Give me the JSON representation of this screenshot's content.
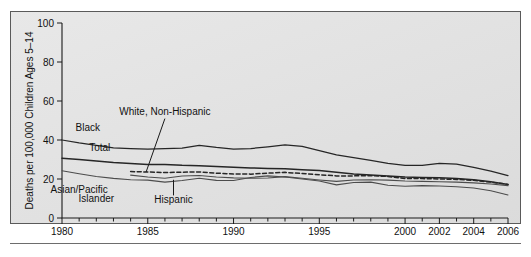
{
  "chart_data": {
    "type": "line",
    "title": "",
    "xlabel": "",
    "ylabel": "Deaths per 100,000 Children Ages 5–14",
    "ylim": [
      0,
      100
    ],
    "xlim": [
      1980,
      2006
    ],
    "yticks": [
      "0",
      "20",
      "40",
      "60",
      "80",
      "100"
    ],
    "ytick_values": [
      0,
      20,
      40,
      60,
      80,
      100
    ],
    "xticks": [
      "1980",
      "1985",
      "1990",
      "1995",
      "2000",
      "2002",
      "2004",
      "2006"
    ],
    "xtick_values": [
      1980,
      1985,
      1990,
      1995,
      2000,
      2002,
      2004,
      2006
    ],
    "minor_tick_interval": 1,
    "grid": false,
    "legend": "inline-annotations",
    "x": [
      1980,
      1981,
      1982,
      1983,
      1984,
      1985,
      1986,
      1987,
      1988,
      1989,
      1990,
      1991,
      1992,
      1993,
      1994,
      1995,
      1996,
      1997,
      1998,
      1999,
      2000,
      2001,
      2002,
      2003,
      2004,
      2005,
      2006
    ],
    "series": [
      {
        "name": "Black",
        "style": "solid",
        "values": [
          40.0,
          38.5,
          37.3,
          36.0,
          35.6,
          35.3,
          35.6,
          35.8,
          37.3,
          36.2,
          35.3,
          35.6,
          36.5,
          37.5,
          36.7,
          34.5,
          32.4,
          31.0,
          29.6,
          28.0,
          27.0,
          27.0,
          28.0,
          27.6,
          26.0,
          24.0,
          21.7
        ]
      },
      {
        "name": "Total",
        "style": "solid",
        "values": [
          30.6,
          30.0,
          29.2,
          28.4,
          28.0,
          27.5,
          27.4,
          27.0,
          26.8,
          26.4,
          26.0,
          25.7,
          25.4,
          25.2,
          24.8,
          24.3,
          23.4,
          22.6,
          22.0,
          21.5,
          21.0,
          20.8,
          20.6,
          20.2,
          19.6,
          18.6,
          17.2
        ]
      },
      {
        "name": "White, Non-Hispanic",
        "style": "dashed",
        "start_year": 1984,
        "values": [
          null,
          null,
          null,
          null,
          23.8,
          23.6,
          23.3,
          23.5,
          23.6,
          23.0,
          22.6,
          22.5,
          23.0,
          23.4,
          22.8,
          22.2,
          21.6,
          21.6,
          21.7,
          21.3,
          20.3,
          20.2,
          20.0,
          19.8,
          19.3,
          18.4,
          17.2
        ]
      },
      {
        "name": "Hispanic",
        "style": "solid-light",
        "start_year": 1984,
        "values": [
          null,
          null,
          null,
          null,
          22.0,
          21.0,
          20.4,
          21.5,
          21.8,
          21.0,
          20.6,
          20.4,
          20.5,
          21.2,
          20.4,
          19.5,
          18.8,
          19.5,
          19.6,
          19.4,
          19.0,
          18.8,
          18.6,
          18.4,
          18.0,
          17.4,
          16.6
        ]
      },
      {
        "name": "Asian/Pacific Islander",
        "style": "solid-light",
        "values": [
          24.2,
          22.7,
          21.3,
          20.3,
          19.6,
          19.4,
          18.4,
          19.2,
          20.4,
          19.3,
          19.2,
          20.8,
          21.6,
          21.0,
          20.0,
          19.0,
          17.0,
          18.2,
          18.4,
          16.8,
          16.3,
          16.6,
          16.4,
          16.0,
          15.4,
          14.0,
          11.8
        ]
      }
    ],
    "annotations": [
      {
        "text": "Black",
        "x": 1981.5,
        "y": 44.5
      },
      {
        "text": "Total",
        "x": 1982.2,
        "y": 34.5
      },
      {
        "text": "White, Non-Hispanic",
        "x": 1986.0,
        "y": 53.0
      },
      {
        "text": "Asian/Pacific",
        "x": 1981.0,
        "y": 13.0
      },
      {
        "text": "Islander",
        "x": 1982.0,
        "y": 8.0
      },
      {
        "text": "Hispanic",
        "x": 1986.5,
        "y": 7.5
      }
    ]
  }
}
